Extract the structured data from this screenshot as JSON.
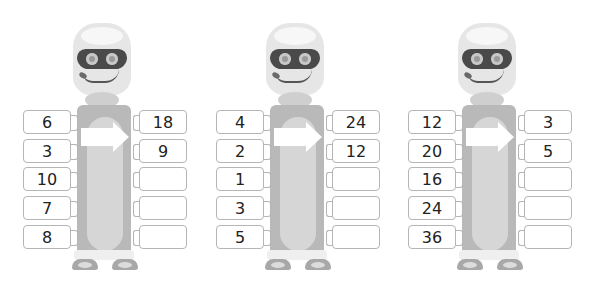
{
  "robots": [
    {
      "inputs": [
        "6",
        "3",
        "10",
        "7",
        "8"
      ],
      "outputs": [
        "18",
        "9",
        "",
        "",
        ""
      ]
    },
    {
      "inputs": [
        "4",
        "2",
        "1",
        "3",
        "5"
      ],
      "outputs": [
        "24",
        "12",
        "",
        "",
        ""
      ]
    },
    {
      "inputs": [
        "12",
        "20",
        "16",
        "24",
        "36"
      ],
      "outputs": [
        "3",
        "5",
        "",
        "",
        ""
      ]
    }
  ],
  "icons": {
    "arrow": "right-arrow-icon"
  }
}
